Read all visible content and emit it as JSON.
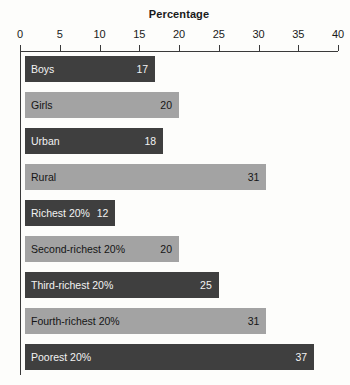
{
  "chart_data": {
    "type": "bar",
    "orientation": "horizontal",
    "title": "Percentage",
    "xlabel": "Percentage",
    "ylabel": "",
    "xlim": [
      0,
      40
    ],
    "xticks": [
      0,
      5,
      10,
      15,
      20,
      25,
      30,
      35,
      40
    ],
    "xtick_labels": [
      "0",
      "5",
      "10",
      "15",
      "20",
      "25",
      "30",
      "35",
      "40"
    ],
    "grid": false,
    "legend": false,
    "axis_position": "top",
    "categories": [
      "Boys",
      "Girls",
      "Urban",
      "Rural",
      "Richest 20%",
      "Second-richest 20%",
      "Third-richest 20%",
      "Fourth-richest 20%",
      "Poorest 20%"
    ],
    "values": [
      17,
      20,
      18,
      31,
      12,
      20,
      25,
      31,
      37
    ],
    "value_labels": [
      "17",
      "20",
      "18",
      "31",
      "12",
      "20",
      "25",
      "31",
      "37"
    ],
    "bar_shades": [
      "dark",
      "light",
      "dark",
      "light",
      "dark",
      "light",
      "dark",
      "light",
      "dark"
    ],
    "colors": {
      "dark": "#3f3f3f",
      "light": "#a3a3a3",
      "background": "#fdfdfb",
      "axis": "#3a3a3a",
      "text_on_dark": "#f2f2f2",
      "text_on_light": "#151515"
    }
  }
}
